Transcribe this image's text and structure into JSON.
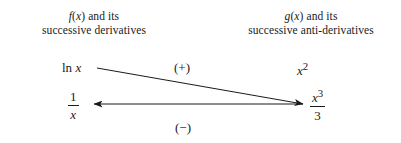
{
  "diagram": {
    "background_color": "#ffffff",
    "line_color": "#1a1a1a",
    "headings": {
      "left_line1": "f(x) and its",
      "left_line2": "successive derivatives",
      "right_line1": "g(x) and its",
      "right_line2": "successive anti-derivatives"
    },
    "nodes": {
      "top_left": "ln x",
      "top_left_fn": "ln",
      "top_left_var": "x",
      "top_right_base": "x",
      "top_right_exp": "2",
      "bottom_left_num": "1",
      "bottom_left_den": "x",
      "bottom_right_num_base": "x",
      "bottom_right_num_exp": "3",
      "bottom_right_den": "3"
    },
    "signs": {
      "upper": "(+)",
      "lower": "(−)"
    },
    "arrows": [
      {
        "name": "diagonal-plus-arrow",
        "from": "ln x",
        "to": "x^3/3",
        "sign": "(+)",
        "x1": 97,
        "y1": 68,
        "x2": 303,
        "y2": 104,
        "direction": "right"
      },
      {
        "name": "horizontal-minus-arrow",
        "from": "x^3/3",
        "to": "1/x",
        "sign": "(−)",
        "x1": 303,
        "y1": 104,
        "x2": 94,
        "y2": 104,
        "direction": "left"
      }
    ]
  }
}
